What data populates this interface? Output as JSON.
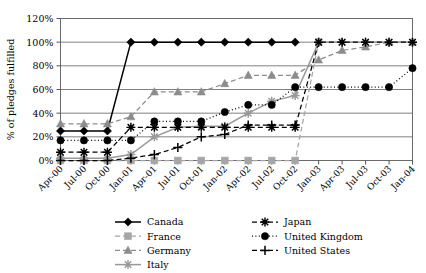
{
  "chart_data": {
    "type": "line",
    "title": "",
    "xlabel": "",
    "ylabel": "% of pledges fulfilled",
    "ylim": [
      0,
      120
    ],
    "ytick_labels": [
      "0%",
      "20%",
      "40%",
      "60%",
      "80%",
      "100%",
      "120%"
    ],
    "ytick_values": [
      0,
      20,
      40,
      60,
      80,
      100,
      120
    ],
    "grid": "horizontal",
    "legend_position": "below-center",
    "categories": [
      "Apr-00",
      "Jul-00",
      "Oct-00",
      "Jan-01",
      "Apr-01",
      "Jul-01",
      "Oct-01",
      "Jan-02",
      "Apr-02",
      "Jul-02",
      "Oct-02",
      "Jan-03",
      "Apr-03",
      "Jul-03",
      "Oct-03",
      "Jan-04"
    ],
    "series": [
      {
        "name": "Canada",
        "color": "#000000",
        "marker": "diamond",
        "line": "solid",
        "values": [
          25,
          25,
          25,
          100,
          100,
          100,
          100,
          100,
          100,
          100,
          100,
          null,
          null,
          null,
          null,
          null
        ]
      },
      {
        "name": "France",
        "color": "#a6a6a6",
        "marker": "square",
        "line": "dashed",
        "values": [
          0,
          0,
          0,
          0,
          0,
          0,
          0,
          0,
          0,
          0,
          0,
          100,
          null,
          null,
          null,
          null
        ]
      },
      {
        "name": "Germany",
        "color": "#8c8c8c",
        "marker": "triangle",
        "line": "dashed",
        "values": [
          31,
          31,
          31,
          37,
          58,
          58,
          58,
          65,
          72,
          72,
          72,
          85,
          93,
          96,
          100,
          100
        ]
      },
      {
        "name": "Italy",
        "color": "#999999",
        "marker": "asterisk",
        "line": "solid",
        "values": [
          2,
          2,
          2,
          5,
          20,
          28,
          29,
          29,
          40,
          50,
          55,
          100,
          100,
          100,
          100,
          100
        ]
      },
      {
        "name": "Japan",
        "color": "#000000",
        "marker": "asterisk",
        "line": "dashed",
        "values": [
          7,
          7,
          7,
          28,
          28,
          28,
          28,
          28,
          28,
          28,
          28,
          100,
          100,
          100,
          100,
          100
        ]
      },
      {
        "name": "United Kingdom",
        "color": "#000000",
        "marker": "circle",
        "line": "dotted",
        "values": [
          17,
          17,
          17,
          17,
          33,
          33,
          33,
          41,
          47,
          47,
          62,
          62,
          62,
          62,
          62,
          78
        ]
      },
      {
        "name": "United States",
        "color": "#000000",
        "marker": "plus",
        "line": "dashed",
        "values": [
          0,
          0,
          0,
          2,
          5,
          11,
          20,
          22,
          30,
          30,
          30,
          null,
          null,
          null,
          null,
          null
        ]
      }
    ]
  },
  "legend": {
    "column1": [
      "Canada",
      "France",
      "Germany",
      "Italy"
    ],
    "column2": [
      "Japan",
      "United Kingdom",
      "United States"
    ]
  }
}
